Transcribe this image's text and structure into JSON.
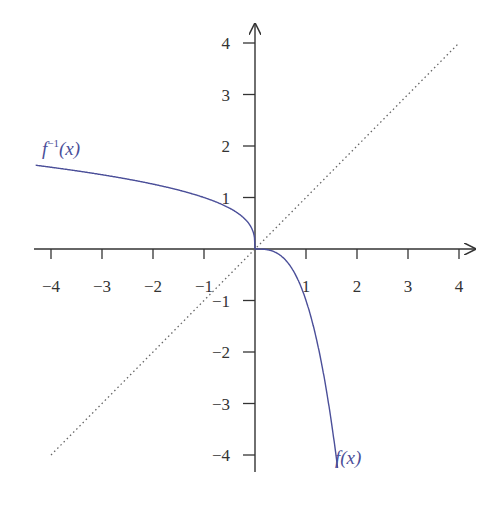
{
  "chart_data": {
    "type": "line",
    "title": "",
    "xlabel": "",
    "ylabel": "",
    "xlim": [
      -4.3,
      4.3
    ],
    "ylim": [
      -4.3,
      4.3
    ],
    "grid": false,
    "x_ticks": [
      -4,
      -3,
      -2,
      -1,
      1,
      2,
      3,
      4
    ],
    "y_ticks": [
      -4,
      -3,
      -2,
      -1,
      1,
      2,
      3,
      4
    ],
    "x_tick_labels": [
      "−4",
      "−3",
      "−2",
      "−1",
      "1",
      "2",
      "3",
      "4"
    ],
    "y_tick_labels": [
      "−4",
      "−3",
      "−2",
      "−1",
      "1",
      "2",
      "3",
      "4"
    ],
    "series": [
      {
        "name": "f(x)",
        "label": "f(x)",
        "expression": "-x^3",
        "color": "#4b4f99",
        "style": "solid",
        "x": [
          0,
          0.25,
          0.5,
          0.75,
          1.0,
          1.25,
          1.5,
          1.62
        ],
        "y": [
          0,
          -0.016,
          -0.125,
          -0.42,
          -1.0,
          -1.95,
          -3.375,
          -4.25
        ]
      },
      {
        "name": "f^-1(x)",
        "label": "f⁻¹(x)",
        "expression": "-cbrt(x)",
        "color": "#4b4f99",
        "style": "solid",
        "x": [
          -4.3,
          -4,
          -3,
          -2,
          -1,
          -0.5,
          -0.125,
          0
        ],
        "y": [
          1.626,
          1.587,
          1.442,
          1.26,
          1.0,
          0.794,
          0.5,
          0
        ]
      },
      {
        "name": "y = x",
        "label": "",
        "expression": "x",
        "color": "#555555",
        "style": "dotted",
        "x": [
          -4,
          4
        ],
        "y": [
          -4,
          4
        ]
      }
    ],
    "annotations": [
      {
        "text": "f⁻¹(x)",
        "x": -3.9,
        "y": 1.85
      },
      {
        "text": "f(x)",
        "x": 1.6,
        "y": -4.0
      }
    ]
  },
  "labels": {
    "finv_main": "f",
    "finv_sup": "−1",
    "finv_arg": "(x)",
    "f_label": "f(x)"
  },
  "colors": {
    "curve": "#4b4f99",
    "axis": "#333333",
    "identity": "#666666"
  }
}
